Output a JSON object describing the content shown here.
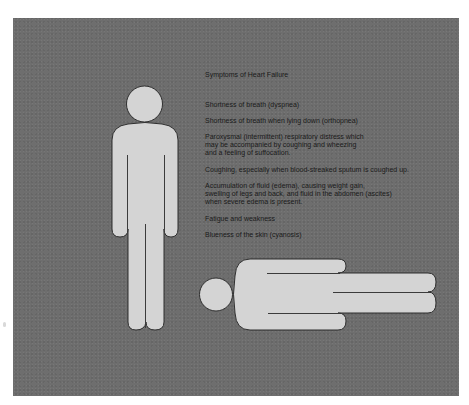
{
  "figure": {
    "title": "Symptoms of Heart Failure",
    "symptoms": [
      {
        "lines": [
          "Shortness of breath (dyspnea)"
        ]
      },
      {
        "lines": [
          "Shortness of breath when lying down (orthopnea)"
        ]
      },
      {
        "lines": [
          "Paroxysmal (intermittent) respiratory distress which",
          "may be accompanied by coughing and wheezing",
          "and a feeling of suffocation."
        ]
      },
      {
        "lines": [
          "Coughing, especially when blood-streaked sputum is coughed up."
        ]
      },
      {
        "lines": [
          "Accumulation of fluid (edema), causing weight gain,",
          "swelling of legs and back, and fluid in the abdomen (ascites)",
          "when severe edema is present."
        ]
      },
      {
        "lines": [
          "Fatigue and weakness"
        ]
      },
      {
        "lines": [
          "Blueness of the skin (cyanosis)"
        ]
      }
    ],
    "illustrations": {
      "standing_figure": "standing-person-silhouette",
      "lying_figure": "lying-person-silhouette"
    },
    "colors": {
      "background_panel": "#6e6e6e",
      "figure_fill": "#d4d4d4",
      "figure_outline": "#2e2e2e",
      "text": "#1a1a1a"
    }
  }
}
